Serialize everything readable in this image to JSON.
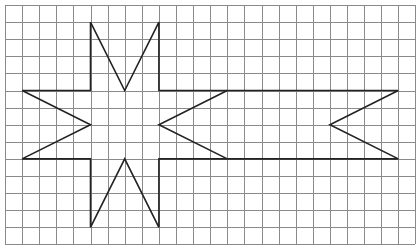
{
  "diagram": {
    "type": "grid-figure",
    "grid": {
      "origin_px": [
        5,
        5
      ],
      "cell_px": 17.1,
      "columns": 24,
      "rows": 14,
      "line_color": "#8a8a8a"
    },
    "shape": {
      "stroke_color": "#222222",
      "outline_points": [
        [
          5,
          1
        ],
        [
          7,
          5
        ],
        [
          9,
          1
        ],
        [
          9,
          5
        ],
        [
          23,
          5
        ],
        [
          19,
          7
        ],
        [
          23,
          9
        ],
        [
          9,
          9
        ],
        [
          9,
          13
        ],
        [
          7,
          9
        ],
        [
          5,
          13
        ],
        [
          5,
          9
        ],
        [
          1,
          9
        ],
        [
          5,
          7
        ],
        [
          1,
          5
        ],
        [
          5,
          5
        ],
        [
          5,
          1
        ]
      ],
      "inner_notch_points": [
        [
          13,
          5
        ],
        [
          9,
          7
        ],
        [
          13,
          9
        ]
      ]
    }
  }
}
